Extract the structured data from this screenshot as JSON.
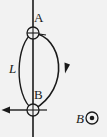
{
  "figure": {
    "background_color": "#f2f2f2",
    "stroke_color": "#1a1a1a",
    "labels": {
      "point_a": "A",
      "point_b": "B",
      "length_l": "L",
      "field_b": "B"
    },
    "icons": {
      "junction_top": "crossed-circle",
      "junction_bottom": "crossed-circle",
      "field_out_of_page": "dot-in-circle",
      "current_direction": "arrowhead-down",
      "current_out_left": "arrowhead-left"
    },
    "geometry": {
      "wire_x": 33,
      "node_a_y": 33,
      "node_b_y": 110,
      "left_arc_extent_x": 14,
      "right_arc_extent_x": 69,
      "node_radius": 6
    },
    "notes": {
      "field_symbol_meaning": "out of page",
      "current_arrow_meaning": "clockwise on right arc, exiting left at B"
    }
  }
}
